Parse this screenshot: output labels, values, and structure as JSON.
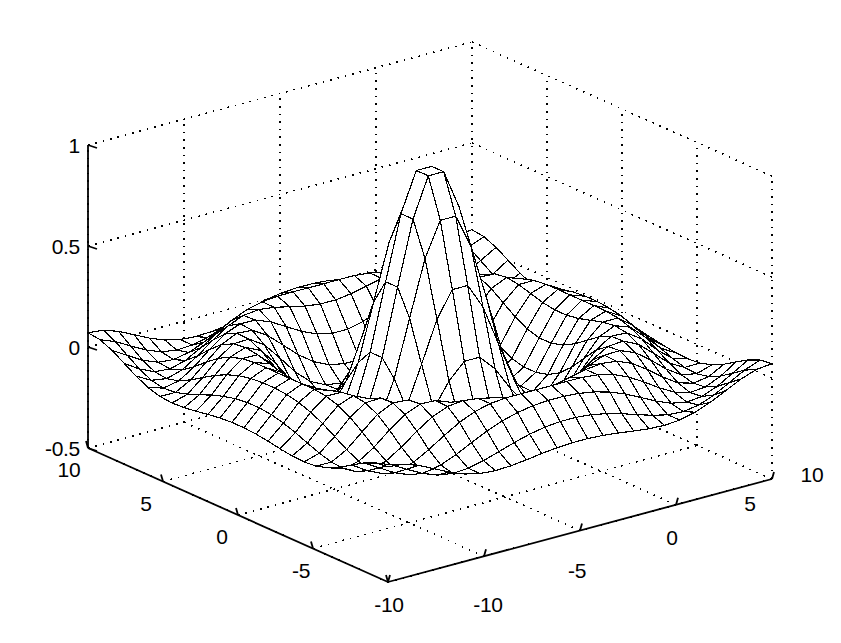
{
  "figure": {
    "background_color": "#ffffff",
    "line_color": "#000000",
    "grid_style": "dotted",
    "type": "mesh-surface-3d"
  },
  "axes": {
    "z": {
      "name": "z-axis",
      "ticks": [
        "1",
        "0.5",
        "0",
        "-0.5"
      ],
      "values": [
        1,
        0.5,
        0,
        -0.5
      ],
      "min": -0.5,
      "max": 1
    },
    "y": {
      "name": "y-axis",
      "ticks": [
        "10",
        "5",
        "0",
        "-5",
        "-10"
      ],
      "values": [
        10,
        5,
        0,
        -5,
        -10
      ],
      "min": -10,
      "max": 10
    },
    "x": {
      "name": "x-axis",
      "ticks": [
        "-10",
        "-5",
        "0",
        "5",
        "10"
      ],
      "values": [
        -10,
        -5,
        0,
        5,
        10
      ],
      "min": -10,
      "max": 10
    }
  },
  "labels": {
    "z_1": "1",
    "z_05": "0.5",
    "z_0": "0",
    "z_m05": "-0.5",
    "y_10": "10",
    "y_5": "5",
    "y_0": "0",
    "y_m5": "-5",
    "y_m10": "-10",
    "x_m10": "-10",
    "x_m5": "-5",
    "x_0": "0",
    "x_5": "5",
    "x_10": "10"
  },
  "chart_data": {
    "type": "surface",
    "title": "",
    "xlabel": "",
    "ylabel": "",
    "zlabel": "",
    "function": "sin(r)/r  where r = sqrt(x^2 + y^2)",
    "x": {
      "min": -10,
      "max": 10,
      "step": 0.8,
      "ticks": [
        -10,
        -5,
        0,
        5,
        10
      ]
    },
    "y": {
      "min": -10,
      "max": 10,
      "step": 0.8,
      "ticks": [
        -10,
        -5,
        0,
        5,
        10
      ]
    },
    "z": {
      "min": -0.5,
      "max": 1,
      "ticks": [
        -0.5,
        0,
        0.5,
        1
      ]
    },
    "grid": true,
    "legend": "none",
    "mesh_rows": 26,
    "mesh_cols": 26,
    "view": {
      "azimuth": -37.5,
      "elevation": 30
    },
    "key_points": [
      {
        "x": 0,
        "y": 0,
        "z": 1.0,
        "note": "central peak"
      },
      {
        "x": 4.49,
        "y": 0,
        "z": -0.217,
        "note": "first trough ring"
      },
      {
        "x": 7.73,
        "y": 0,
        "z": 0.128,
        "note": "second ripple ring"
      },
      {
        "x": 10,
        "y": 10,
        "z": -0.039,
        "note": "corner value"
      }
    ]
  }
}
